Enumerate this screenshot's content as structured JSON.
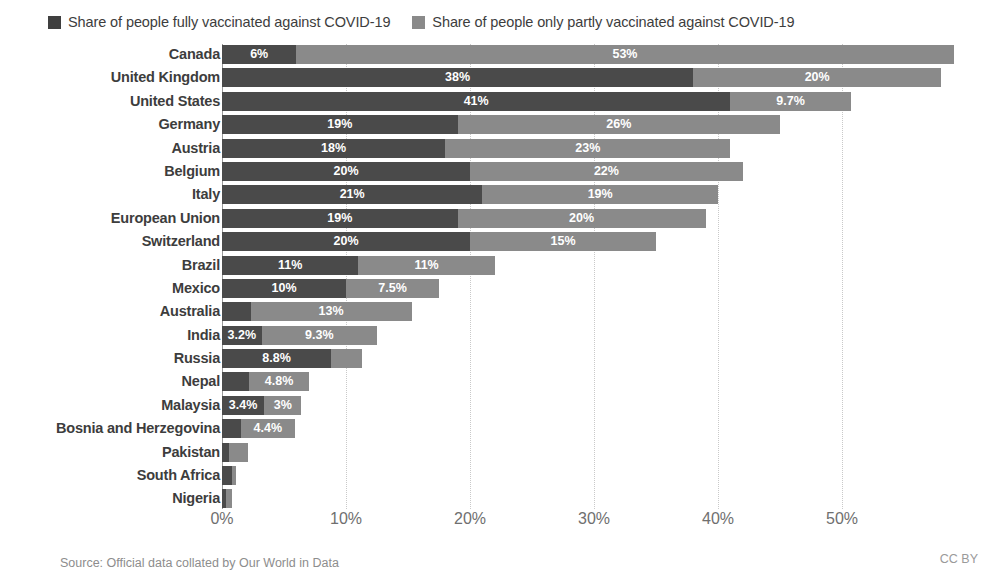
{
  "legend": {
    "position": "top-left",
    "entries": [
      {
        "label": "Share of people fully vaccinated against COVID-19",
        "color": "#3f3f3f",
        "key": "fully"
      },
      {
        "label": "Share of people only partly vaccinated against COVID-19",
        "color": "#8a8a8a",
        "key": "partly"
      }
    ]
  },
  "footer": {
    "source": "Source: Official data collated by Our World in Data",
    "license": "CC BY"
  },
  "colors": {
    "fully_vaccinated": "#4a4a4a",
    "partly_vaccinated": "#8a8a8a",
    "gridline": "#c9c9c9",
    "axis": "#9a9a9a",
    "text": "#3d3d3d",
    "tick_text": "#6f6f6f",
    "footer_text": "#8d8d8d",
    "background": "#ffffff"
  },
  "chart_data": {
    "type": "bar",
    "orientation": "horizontal",
    "stacked": true,
    "title": "",
    "subtitle": "",
    "xlabel": "",
    "ylabel": "",
    "xlim": [
      0,
      58
    ],
    "grid": true,
    "legend_position": "top-left",
    "axis_ticks": [
      "0%",
      "10%",
      "20%",
      "30%",
      "40%",
      "50%"
    ],
    "axis_tick_values": [
      0,
      10,
      20,
      30,
      40,
      50
    ],
    "categories": [
      "Canada",
      "United Kingdom",
      "United States",
      "Germany",
      "Austria",
      "Belgium",
      "Italy",
      "European Union",
      "Switzerland",
      "Brazil",
      "Mexico",
      "Australia",
      "India",
      "Russia",
      "Nepal",
      "Malaysia",
      "Bosnia and Herzegovina",
      "Pakistan",
      "South Africa",
      "Nigeria"
    ],
    "series": [
      {
        "name": "Share of people fully vaccinated against COVID-19",
        "color": "#4a4a4a",
        "values": [
          6,
          38,
          41,
          19,
          18,
          20,
          21,
          19,
          20,
          11,
          10,
          2.3,
          3.2,
          8.8,
          2.2,
          3.4,
          1.5,
          0.6,
          0.8,
          0.35
        ],
        "labels": [
          "6%",
          "38%",
          "41%",
          "19%",
          "18%",
          "20%",
          "21%",
          "19%",
          "20%",
          "11%",
          "10%",
          "",
          "3.2%",
          "8.8%",
          "",
          "3.4%",
          "",
          "",
          "",
          ""
        ]
      },
      {
        "name": "Share of people only partly vaccinated against COVID-19",
        "color": "#8a8a8a",
        "values": [
          53,
          20,
          9.7,
          26,
          23,
          22,
          19,
          20,
          15,
          11,
          7.5,
          13,
          9.3,
          2.5,
          4.8,
          3,
          4.4,
          1.5,
          0.3,
          0.45
        ],
        "labels": [
          "53%",
          "20%",
          "9.7%",
          "26%",
          "23%",
          "22%",
          "19%",
          "20%",
          "15%",
          "11%",
          "7.5%",
          "13%",
          "9.3%",
          "",
          "4.8%",
          "3%",
          "4.4%",
          "",
          "",
          ""
        ]
      }
    ],
    "rows": [
      {
        "category": "Canada",
        "fully": 6,
        "partly": 53,
        "fully_label": "6%",
        "partly_label": "53%"
      },
      {
        "category": "United Kingdom",
        "fully": 38,
        "partly": 20,
        "fully_label": "38%",
        "partly_label": "20%"
      },
      {
        "category": "United States",
        "fully": 41,
        "partly": 9.7,
        "fully_label": "41%",
        "partly_label": "9.7%"
      },
      {
        "category": "Germany",
        "fully": 19,
        "partly": 26,
        "fully_label": "19%",
        "partly_label": "26%"
      },
      {
        "category": "Austria",
        "fully": 18,
        "partly": 23,
        "fully_label": "18%",
        "partly_label": "23%"
      },
      {
        "category": "Belgium",
        "fully": 20,
        "partly": 22,
        "fully_label": "20%",
        "partly_label": "22%"
      },
      {
        "category": "Italy",
        "fully": 21,
        "partly": 19,
        "fully_label": "21%",
        "partly_label": "19%"
      },
      {
        "category": "European Union",
        "fully": 19,
        "partly": 20,
        "fully_label": "19%",
        "partly_label": "20%"
      },
      {
        "category": "Switzerland",
        "fully": 20,
        "partly": 15,
        "fully_label": "20%",
        "partly_label": "15%"
      },
      {
        "category": "Brazil",
        "fully": 11,
        "partly": 11,
        "fully_label": "11%",
        "partly_label": "11%"
      },
      {
        "category": "Mexico",
        "fully": 10,
        "partly": 7.5,
        "fully_label": "10%",
        "partly_label": "7.5%"
      },
      {
        "category": "Australia",
        "fully": 2.3,
        "partly": 13,
        "fully_label": "",
        "partly_label": "13%"
      },
      {
        "category": "India",
        "fully": 3.2,
        "partly": 9.3,
        "fully_label": "3.2%",
        "partly_label": "9.3%"
      },
      {
        "category": "Russia",
        "fully": 8.8,
        "partly": 2.5,
        "fully_label": "8.8%",
        "partly_label": ""
      },
      {
        "category": "Nepal",
        "fully": 2.2,
        "partly": 4.8,
        "fully_label": "",
        "partly_label": "4.8%"
      },
      {
        "category": "Malaysia",
        "fully": 3.4,
        "partly": 3,
        "fully_label": "3.4%",
        "partly_label": "3%"
      },
      {
        "category": "Bosnia and Herzegovina",
        "fully": 1.5,
        "partly": 4.4,
        "fully_label": "",
        "partly_label": "4.4%"
      },
      {
        "category": "Pakistan",
        "fully": 0.6,
        "partly": 1.5,
        "fully_label": "",
        "partly_label": ""
      },
      {
        "category": "South Africa",
        "fully": 0.8,
        "partly": 0.3,
        "fully_label": "",
        "partly_label": ""
      },
      {
        "category": "Nigeria",
        "fully": 0.35,
        "partly": 0.45,
        "fully_label": "",
        "partly_label": ""
      }
    ]
  }
}
